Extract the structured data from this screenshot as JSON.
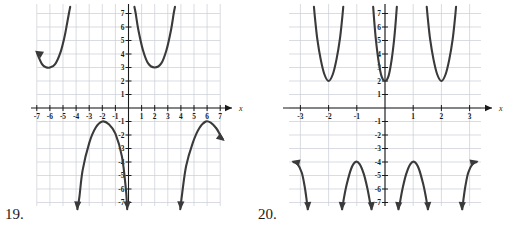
{
  "page": {
    "background": "#ffffff",
    "ink_color": "#333333",
    "grid_color": "#c8cdd6",
    "axis_color": "#1a1a1a",
    "curve_color": "#3a3a3a"
  },
  "figures": [
    {
      "number_label": "19.",
      "name": "graph-19",
      "axis_label_x": "x",
      "x_ticks": [
        "-7",
        "-6",
        "-5",
        "-4",
        "-3",
        "-2",
        "-1",
        "1",
        "2",
        "3",
        "4",
        "5",
        "6",
        "7"
      ],
      "y_ticks": [
        "7",
        "6",
        "5",
        "4",
        "3",
        "2",
        "1",
        "-1",
        "-2",
        "-3",
        "-4",
        "-5",
        "-6",
        "-7"
      ],
      "xlim": [
        -7.5,
        7.5
      ],
      "ylim": [
        -7.5,
        7.5
      ],
      "grid": true,
      "branches": [
        {
          "name": "upper-left-branch",
          "vertex": [
            -6,
            3
          ],
          "opens": "up",
          "arrow": "left-up"
        },
        {
          "name": "upper-right-branch",
          "vertex": [
            2,
            3
          ],
          "opens": "up",
          "arrow": "none"
        },
        {
          "name": "lower-left-branch",
          "vertex": [
            -2,
            -1
          ],
          "opens": "down",
          "arrow": "down-down"
        },
        {
          "name": "lower-right-branch",
          "vertex": [
            6,
            -1
          ],
          "opens": "down",
          "arrow": "down-right"
        }
      ]
    },
    {
      "number_label": "20.",
      "name": "graph-20",
      "axis_label_x": "x",
      "x_ticks": [
        "-3",
        "-2",
        "-1",
        "1",
        "2",
        "3"
      ],
      "y_ticks": [
        "7",
        "6",
        "5",
        "4",
        "3",
        "2",
        "1",
        "-1",
        "-2",
        "-3",
        "-4",
        "-5",
        "-6",
        "-7"
      ],
      "xlim": [
        -3.4,
        3.4
      ],
      "ylim": [
        -7.5,
        7.5
      ],
      "grid": true,
      "branches": [
        {
          "name": "upper-branch-left",
          "vertex": [
            -2,
            2
          ],
          "opens": "up",
          "arrow": "none"
        },
        {
          "name": "upper-branch-center",
          "vertex": [
            0,
            2
          ],
          "opens": "up",
          "arrow": "none"
        },
        {
          "name": "upper-branch-right",
          "vertex": [
            2,
            2
          ],
          "opens": "up",
          "arrow": "none"
        },
        {
          "name": "lower-branch-far-left",
          "vertex": [
            -3,
            -4
          ],
          "opens": "down",
          "arrow": "left-down"
        },
        {
          "name": "lower-branch-left",
          "vertex": [
            -1,
            -4
          ],
          "opens": "down",
          "arrow": "down-down"
        },
        {
          "name": "lower-branch-right",
          "vertex": [
            1,
            -4
          ],
          "opens": "down",
          "arrow": "down-down"
        },
        {
          "name": "lower-branch-far-right",
          "vertex": [
            3,
            -4
          ],
          "opens": "down",
          "arrow": "right-down"
        }
      ]
    }
  ],
  "chart_data": [
    {
      "type": "line",
      "title": "",
      "xlabel": "x",
      "ylabel": "",
      "xlim": [
        -7.5,
        7.5
      ],
      "ylim": [
        -7.5,
        7.5
      ],
      "grid": true,
      "legend": "none",
      "xticks": [
        -7,
        -6,
        -5,
        -4,
        -3,
        -2,
        -1,
        1,
        2,
        3,
        4,
        5,
        6,
        7
      ],
      "yticks": [
        7,
        6,
        5,
        4,
        3,
        2,
        1,
        -1,
        -2,
        -3,
        -4,
        -5,
        -6,
        -7
      ],
      "series": [
        {
          "name": "branch-upper-left",
          "vertex": [
            -6,
            3
          ],
          "x": [
            -7.0,
            -6.6,
            -6.3,
            -6.0,
            -5.6,
            -5.2,
            -4.9,
            -4.7,
            -4.55,
            -4.45
          ],
          "y": [
            4.1,
            3.25,
            3.02,
            3.0,
            3.25,
            4.1,
            5.2,
            6.2,
            7.0,
            7.5
          ]
        },
        {
          "name": "branch-upper-right",
          "vertex": [
            2,
            3
          ],
          "x": [
            0.45,
            0.55,
            0.75,
            1.1,
            1.5,
            2.0,
            2.5,
            2.9,
            3.25,
            3.45,
            3.55
          ],
          "y": [
            7.5,
            7.0,
            5.8,
            4.3,
            3.3,
            3.0,
            3.3,
            4.3,
            5.8,
            7.0,
            7.5
          ]
        },
        {
          "name": "branch-lower-left",
          "vertex": [
            -2,
            -1
          ],
          "x": [
            -3.9,
            -3.75,
            -3.5,
            -3.0,
            -2.5,
            -2.0,
            -1.5,
            -1.0,
            -0.5,
            -0.2,
            -0.1
          ],
          "y": [
            -7.5,
            -6.6,
            -4.6,
            -2.6,
            -1.45,
            -1.0,
            -1.2,
            -1.9,
            -3.6,
            -6.0,
            -7.5
          ]
        },
        {
          "name": "branch-lower-right",
          "vertex": [
            6,
            -1
          ],
          "x": [
            3.95,
            4.1,
            4.4,
            4.9,
            5.4,
            5.9,
            6.3,
            6.7,
            7.0,
            7.2
          ],
          "y": [
            -7.5,
            -6.3,
            -4.3,
            -2.6,
            -1.5,
            -1.0,
            -1.1,
            -1.5,
            -2.0,
            -2.3
          ]
        }
      ]
    },
    {
      "type": "line",
      "title": "",
      "xlabel": "x",
      "ylabel": "",
      "xlim": [
        -3.4,
        3.4
      ],
      "ylim": [
        -7.5,
        7.5
      ],
      "grid": true,
      "legend": "none",
      "xticks": [
        -3,
        -2,
        -1,
        1,
        2,
        3
      ],
      "yticks": [
        7,
        6,
        5,
        4,
        3,
        2,
        1,
        -1,
        -2,
        -3,
        -4,
        -5,
        -6,
        -7
      ],
      "series": [
        {
          "name": "upper-branch-left",
          "vertex": [
            -2,
            2
          ],
          "x": [
            -2.52,
            -2.48,
            -2.4,
            -2.28,
            -2.15,
            -2.0,
            -1.85,
            -1.72,
            -1.6,
            -1.52,
            -1.48
          ],
          "y": [
            7.5,
            6.6,
            5.1,
            3.6,
            2.5,
            2.0,
            2.5,
            3.6,
            5.1,
            6.6,
            7.5
          ]
        },
        {
          "name": "upper-branch-center",
          "vertex": [
            0,
            2
          ],
          "x": [
            -0.42,
            -0.38,
            -0.32,
            -0.23,
            -0.13,
            0.0,
            0.13,
            0.23,
            0.32,
            0.38,
            0.42
          ],
          "y": [
            7.5,
            6.4,
            5.0,
            3.5,
            2.4,
            2.0,
            2.4,
            3.5,
            5.0,
            6.4,
            7.5
          ]
        },
        {
          "name": "upper-branch-right",
          "vertex": [
            2,
            2
          ],
          "x": [
            1.48,
            1.52,
            1.6,
            1.72,
            1.85,
            2.0,
            2.15,
            2.28,
            2.4,
            2.48,
            2.52
          ],
          "y": [
            7.5,
            6.6,
            5.1,
            3.6,
            2.5,
            2.0,
            2.5,
            3.6,
            5.1,
            6.6,
            7.5
          ]
        },
        {
          "name": "lower-branch-far-left",
          "vertex": [
            -3,
            -4
          ],
          "x": [
            -3.25,
            -3.1,
            -2.95,
            -2.85,
            -2.78,
            -2.74
          ],
          "y": [
            -4.0,
            -4.15,
            -4.8,
            -5.8,
            -6.8,
            -7.5
          ]
        },
        {
          "name": "lower-branch-left",
          "vertex": [
            -1,
            -4
          ],
          "x": [
            -1.52,
            -1.45,
            -1.35,
            -1.2,
            -1.05,
            -0.9,
            -0.75,
            -0.62,
            -0.53,
            -0.48
          ],
          "y": [
            -7.5,
            -6.6,
            -5.6,
            -4.5,
            -4.0,
            -4.15,
            -4.9,
            -6.0,
            -7.0,
            -7.5
          ]
        },
        {
          "name": "lower-branch-right",
          "vertex": [
            1,
            -4
          ],
          "x": [
            0.48,
            0.53,
            0.62,
            0.75,
            0.9,
            1.05,
            1.2,
            1.35,
            1.45,
            1.52
          ],
          "y": [
            -7.5,
            -7.0,
            -6.0,
            -4.9,
            -4.15,
            -4.0,
            -4.5,
            -5.6,
            -6.6,
            -7.5
          ]
        },
        {
          "name": "lower-branch-far-right",
          "vertex": [
            3,
            -4
          ],
          "x": [
            2.74,
            2.78,
            2.85,
            2.95,
            3.1,
            3.25
          ],
          "y": [
            -7.5,
            -6.8,
            -5.8,
            -4.8,
            -4.15,
            -4.0
          ]
        }
      ]
    }
  ]
}
